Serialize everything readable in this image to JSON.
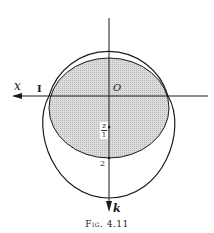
{
  "figure": {
    "caption": "Fig. 4.11",
    "labels": {
      "x_axis": "x",
      "origin": "O",
      "left_intersection": "I",
      "down_axis": "k",
      "lower_point": "2",
      "fraction_num": "z",
      "fraction_den": "1"
    },
    "colors": {
      "line": "#1a1a1a",
      "shade": "#d2d2d2",
      "background": "#ffffff"
    },
    "geometry": {
      "origin": [
        109,
        96
      ],
      "outer_upper_arc_top_y": 35,
      "outer_lower_circle_bottom_y": 198,
      "shaded_top_y": 59,
      "shaded_bottom_y": 158,
      "intersections_x": [
        49,
        168
      ]
    }
  }
}
